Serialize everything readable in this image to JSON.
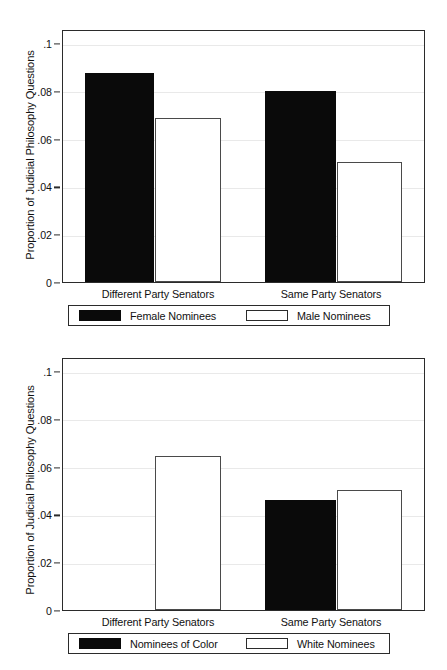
{
  "chart_data": [
    {
      "id": "gender",
      "type": "bar",
      "title": "",
      "xlabel": "",
      "ylabel": "Proportion of Judicial Philosophy Questions",
      "ylim": [
        0,
        0.105
      ],
      "ytick_labels": [
        "0",
        ".02",
        ".04",
        ".06",
        ".08",
        ".1"
      ],
      "ytick_values": [
        0,
        0.02,
        0.04,
        0.06,
        0.08,
        0.1
      ],
      "grid": true,
      "legend_position": "bottom",
      "categories": [
        "Different Party Senators",
        "Same Party Senators"
      ],
      "series": [
        {
          "name": "Female Nominees",
          "style": "solid",
          "color": "#0a0a0a",
          "values": [
            0.0875,
            0.08
          ]
        },
        {
          "name": "Male Nominees",
          "style": "hollow",
          "color": "#ffffff",
          "values": [
            0.0685,
            0.05
          ]
        }
      ]
    },
    {
      "id": "race",
      "type": "bar",
      "title": "",
      "xlabel": "",
      "ylabel": "Proportion of Judicial Philosophy Questions",
      "ylim": [
        0,
        0.105
      ],
      "ytick_labels": [
        "0",
        ".02",
        ".04",
        ".06",
        ".08",
        ".1"
      ],
      "ytick_values": [
        0,
        0.02,
        0.04,
        0.06,
        0.08,
        0.1
      ],
      "grid": true,
      "legend_position": "bottom",
      "categories": [
        "Different Party Senators",
        "Same Party Senators"
      ],
      "series": [
        {
          "name": "Nominees of Color",
          "style": "solid",
          "color": "#0a0a0a",
          "values": [
            0,
            0.0462
          ]
        },
        {
          "name": "White Nominees",
          "style": "hollow",
          "color": "#ffffff",
          "values": [
            0.0645,
            0.05
          ]
        }
      ]
    }
  ],
  "figures": {
    "top": {
      "ylabel": "Proportion of Judicial Philosophy Questions",
      "yticks": [
        {
          "label": ".1",
          "value": 0.1
        },
        {
          "label": ".08",
          "value": 0.08
        },
        {
          "label": ".06",
          "value": 0.06
        },
        {
          "label": ".04",
          "value": 0.04
        },
        {
          "label": ".02",
          "value": 0.02
        },
        {
          "label": "0",
          "value": 0.0
        }
      ],
      "xlabels": [
        "Different Party Senators",
        "Same Party Senators"
      ],
      "legend": [
        {
          "label": "Female Nominees",
          "style": "solid"
        },
        {
          "label": "Male Nominees",
          "style": "hollow"
        }
      ],
      "bars": [
        {
          "group": 0,
          "series": 0,
          "value": 0.0875,
          "style": "solid"
        },
        {
          "group": 0,
          "series": 1,
          "value": 0.0685,
          "style": "hollow"
        },
        {
          "group": 1,
          "series": 0,
          "value": 0.08,
          "style": "solid"
        },
        {
          "group": 1,
          "series": 1,
          "value": 0.05,
          "style": "hollow"
        }
      ]
    },
    "bottom": {
      "ylabel": "Proportion of Judicial Philosophy Questions",
      "yticks": [
        {
          "label": ".1",
          "value": 0.1
        },
        {
          "label": ".08",
          "value": 0.08
        },
        {
          "label": ".06",
          "value": 0.06
        },
        {
          "label": ".04",
          "value": 0.04
        },
        {
          "label": ".02",
          "value": 0.02
        },
        {
          "label": "0",
          "value": 0.0
        }
      ],
      "xlabels": [
        "Different Party Senators",
        "Same Party Senators"
      ],
      "legend": [
        {
          "label": "Nominees of Color",
          "style": "solid"
        },
        {
          "label": "White Nominees",
          "style": "hollow"
        }
      ],
      "bars": [
        {
          "group": 0,
          "series": 0,
          "value": 0.0,
          "style": "solid"
        },
        {
          "group": 0,
          "series": 1,
          "value": 0.0645,
          "style": "hollow"
        },
        {
          "group": 1,
          "series": 0,
          "value": 0.0462,
          "style": "solid"
        },
        {
          "group": 1,
          "series": 1,
          "value": 0.05,
          "style": "hollow"
        }
      ]
    }
  }
}
